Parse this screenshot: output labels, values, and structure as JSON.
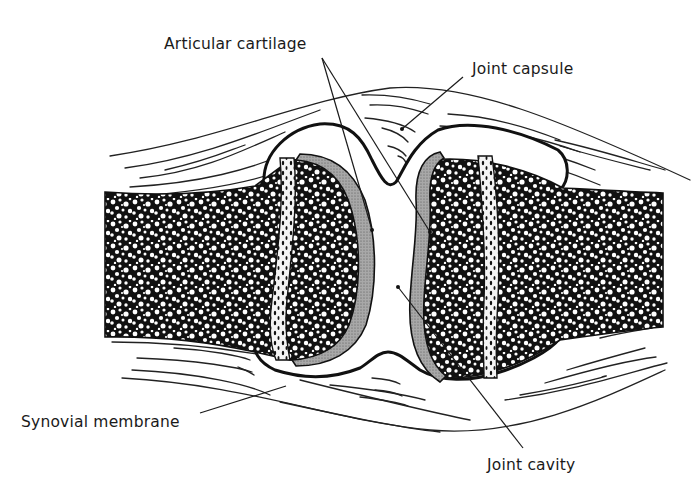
{
  "figure": {
    "labels": {
      "articular_cartilage": "Articular cartilage",
      "joint_capsule": "Joint capsule",
      "synovial_membrane": "Synovial membrane",
      "joint_cavity": "Joint cavity"
    },
    "structures": [
      "left-bone",
      "right-bone",
      "articular-cartilage-left",
      "articular-cartilage-right",
      "joint-capsule",
      "synovial-membrane",
      "joint-cavity",
      "epiphyseal-line-left",
      "epiphyseal-line-right",
      "soft-tissue-fibers"
    ],
    "colors": {
      "ink": "#111111",
      "cartilage": "#9a9a9a",
      "background": "#ffffff"
    }
  }
}
